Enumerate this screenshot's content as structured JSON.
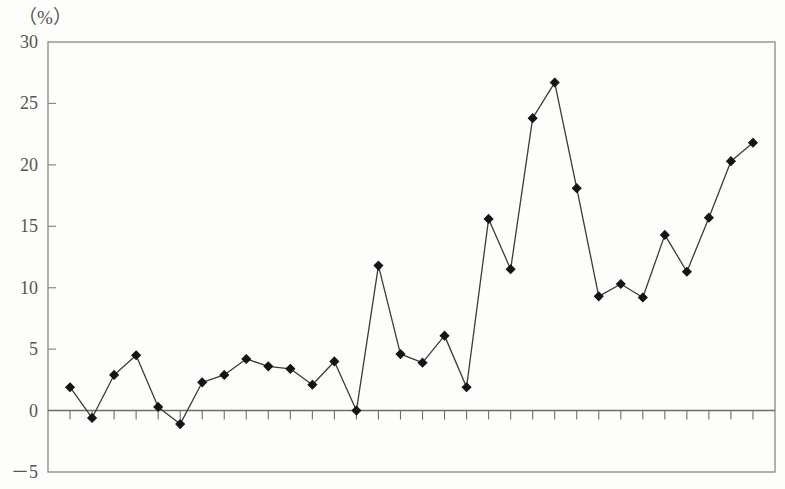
{
  "chart_data": {
    "type": "line",
    "title": "",
    "subtitle": "",
    "xlabel": "",
    "ylabel": "",
    "unit_label": "（%）",
    "ylim": [
      -5,
      30
    ],
    "y_ticks": [
      30,
      25,
      20,
      15,
      10,
      5,
      0,
      -5
    ],
    "y_tick_labels": [
      "30",
      "25",
      "20",
      "15",
      "10",
      "5",
      "0",
      "－5"
    ],
    "grid": false,
    "legend": null,
    "x_tick_labels_shown": false,
    "x_tick_count": 32,
    "marker": "diamond",
    "marker_color": "#141414",
    "line_color": "#3b3b38",
    "zero_line": 0,
    "categories": [
      "1",
      "2",
      "3",
      "4",
      "5",
      "6",
      "7",
      "8",
      "9",
      "10",
      "11",
      "12",
      "13",
      "14",
      "15",
      "16",
      "17",
      "18",
      "19",
      "20",
      "21",
      "22",
      "23",
      "24",
      "25",
      "26",
      "27",
      "28",
      "29",
      "30",
      "31",
      "32"
    ],
    "values": [
      1.9,
      -0.6,
      2.9,
      4.5,
      0.3,
      -1.1,
      2.3,
      2.9,
      4.2,
      3.6,
      3.4,
      2.1,
      4.0,
      0.0,
      11.8,
      4.6,
      3.9,
      6.1,
      1.9,
      15.6,
      11.5,
      23.8,
      26.7,
      18.1,
      9.3,
      10.3,
      9.2,
      14.3,
      11.3,
      15.7,
      20.3,
      21.8
    ],
    "series": [
      {
        "name": "series-1",
        "values": [
          1.9,
          -0.6,
          2.9,
          4.5,
          0.3,
          -1.1,
          2.3,
          2.9,
          4.2,
          3.6,
          3.4,
          2.1,
          4.0,
          0.0,
          11.8,
          4.6,
          3.9,
          6.1,
          1.9,
          15.6,
          11.5,
          23.8,
          26.7,
          18.1,
          9.3,
          10.3,
          9.2,
          14.3,
          11.3,
          15.7,
          20.3,
          21.8
        ]
      }
    ],
    "annotations": []
  },
  "colors": {
    "frame": "#8a8a82",
    "axis_zero": "#6e6e68",
    "line": "#3b3b38",
    "marker": "#141414",
    "text": "#55554f",
    "background": "#fdfdfb"
  }
}
